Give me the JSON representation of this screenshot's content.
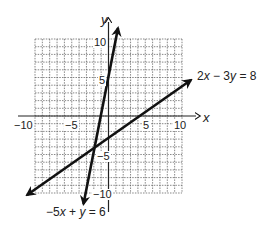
{
  "chart_data": {
    "type": "line",
    "title": "",
    "xlabel": "x",
    "ylabel": "y",
    "xlim": [
      -10,
      10
    ],
    "ylim": [
      -10,
      10
    ],
    "grid": true,
    "grid_step": 1,
    "x_ticks": [
      {
        "value": -10,
        "label": "−10"
      },
      {
        "value": -5,
        "label": "−5"
      },
      {
        "value": 5,
        "label": "5"
      },
      {
        "value": 10,
        "label": "10"
      }
    ],
    "y_ticks": [
      {
        "value": 10,
        "label": "10"
      },
      {
        "value": 5,
        "label": "5"
      },
      {
        "value": -5,
        "label": "−5"
      },
      {
        "value": -10,
        "label": "−10"
      }
    ],
    "series": [
      {
        "name": "2x − 3y = 8",
        "equation": "2x - 3y = 8",
        "slope": 0.6667,
        "intercept": -2.6667,
        "x": [
          -12.4,
          11.6
        ],
        "y": [
          -10.9,
          5.0
        ],
        "arrows": "both"
      },
      {
        "name": "−5x + y = 6",
        "equation": "-5x + y = 6",
        "slope": 5,
        "intercept": 6,
        "x": [
          -3.4,
          1.3
        ],
        "y": [
          -11.5,
          11.6
        ],
        "arrows": "both"
      }
    ],
    "intersection": {
      "x": -2,
      "y": -4
    },
    "annotations": [
      {
        "text": "2x − 3y = 8",
        "near": "upper-right arrow"
      },
      {
        "text": "−5x + y = 6",
        "near": "lower arrow"
      }
    ]
  },
  "labels": {
    "axis_x": "x",
    "axis_y": "y",
    "line1_a": "2",
    "line1_b": "x",
    "line1_c": " − 3",
    "line1_d": "y",
    "line1_e": " = 8",
    "line2_a": "−5",
    "line2_b": "x",
    "line2_c": " + ",
    "line2_d": "y",
    "line2_e": " = 6",
    "xt_m10": "−10",
    "xt_m5": "−5",
    "xt_5": "5",
    "xt_10": "10",
    "yt_10": "10",
    "yt_5": "5",
    "yt_m5": "−5",
    "yt_m10": "−10"
  }
}
